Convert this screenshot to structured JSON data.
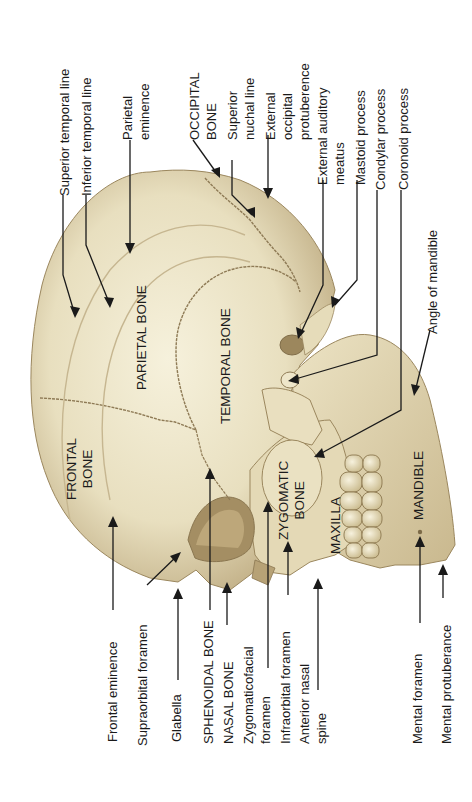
{
  "figure": {
    "colors": {
      "background": "#ffffff",
      "bone_light": "#efe8cf",
      "bone_mid": "#d9cca3",
      "bone_shadow": "#a8946a",
      "suture": "#8e7a55",
      "leader_line": "#1a1a1a"
    }
  },
  "bones": {
    "frontal": [
      "FRONTAL",
      "BONE"
    ],
    "parietal": "PARIETAL BONE",
    "temporal": "TEMPORAL BONE",
    "zygomatic": [
      "ZYGOMATIC",
      "BONE"
    ],
    "maxilla": "MAXILLA",
    "mandible": "MANDIBLE"
  },
  "labels_top": {
    "superior_temporal_line": "Superior temporal line",
    "inferior_temporal_line": "Inferior temporal line",
    "parietal_eminence": [
      "Parietal",
      "eminence"
    ],
    "occipital_bone": [
      "OCCIPITAL",
      "BONE"
    ],
    "superior_nuchal_line": [
      "Superior",
      "nuchal line"
    ],
    "external_occipital_protuberence": [
      "External",
      "occipital",
      "protuberence"
    ],
    "external_auditory_meatus": [
      "External auditory",
      "meatus"
    ],
    "mastoid_process": "Mastoid process",
    "condylar_process": "Condylar process",
    "coronoid_process": "Coronoid process",
    "angle_of_mandible": "Angle of mandible"
  },
  "labels_bottom": {
    "frontal_eminence": "Frontal eminence",
    "supraorbital_foramen": "Supraorbital foramen",
    "glabella": "Glabella",
    "sphenoidal_bone": "SPHENOIDAL BONE",
    "nasal_bone": "NASAL BONE",
    "zygomaticofacial_foramen": [
      "Zygomaticofacial",
      "foramen"
    ],
    "infraorbital_foramen": "Infraorbital foramen",
    "anterior_nasal_spine": [
      "Anterior nasal",
      "spine"
    ],
    "mental_foramen": "Mental foramen",
    "mental_protuberance": "Mental protuberance"
  }
}
